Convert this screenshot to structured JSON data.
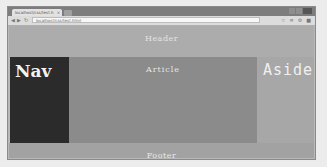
{
  "browser": {
    "tab_title": "localhost/css/test.h",
    "tab_close": "×",
    "address": "localhost/css/test.html",
    "nav_icons": {
      "back": "◀",
      "forward": "▶",
      "reload": "↻"
    },
    "toolbar_icons": [
      "☆",
      "≡",
      "⚙",
      "■"
    ]
  },
  "page": {
    "header": "Header",
    "nav": "Nav",
    "article": "Article",
    "aside": "Aside",
    "footer": "Footer"
  },
  "colors": {
    "header_bg": "#acacac",
    "nav_bg": "#2b2b2b",
    "article_bg": "#8b8b8b",
    "aside_bg": "#a7a7a7",
    "footer_bg": "#a2a2a2"
  }
}
